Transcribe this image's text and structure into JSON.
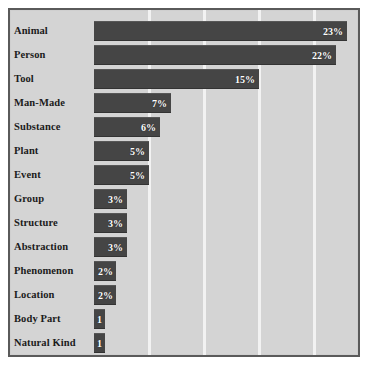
{
  "chart_data": {
    "type": "bar",
    "orientation": "horizontal",
    "title": "",
    "xlabel": "",
    "ylabel": "",
    "grid": true,
    "gridlines_at": [
      5,
      10,
      15,
      20
    ],
    "xlim": [
      0,
      24
    ],
    "legend": "none",
    "colors": {
      "bar": "#454545",
      "plot_background": "#d4d4d4",
      "gridline": "#f2f2f2",
      "frame_border": "#5a5a5a",
      "value_label": "#ffffff",
      "category_label": "#1b1b1b",
      "page_background": "#ffffff"
    },
    "categories": [
      "Animal",
      "Person",
      "Tool",
      "Man-Made",
      "Substance",
      "Plant",
      "Event",
      "Group",
      "Structure",
      "Abstraction",
      "Phenomenon",
      "Location",
      "Body Part",
      "Natural Kind"
    ],
    "values": [
      23,
      22,
      15,
      7,
      6,
      5,
      5,
      3,
      3,
      3,
      2,
      2,
      1,
      1
    ],
    "value_labels": [
      "23%",
      "22%",
      "15%",
      "7%",
      "6%",
      "5%",
      "5%",
      "3%",
      "3%",
      "3%",
      "2%",
      "2%",
      "1",
      "1"
    ]
  }
}
